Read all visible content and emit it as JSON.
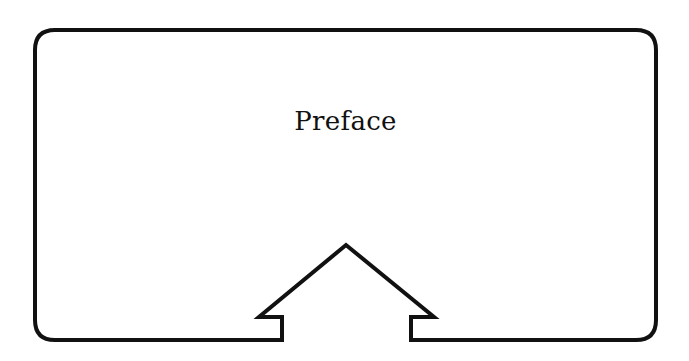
{
  "diagram": {
    "title": "Preface",
    "shape": "rounded-rectangle-frame",
    "arrow": "up-arrow-notch-on-bottom-edge",
    "stroke_color": "#111111",
    "background_color": "#ffffff"
  }
}
